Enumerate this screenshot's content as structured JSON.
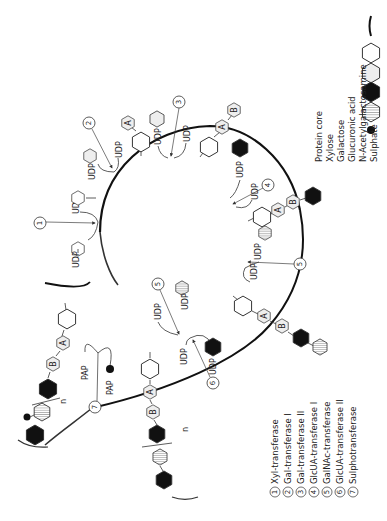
{
  "legend": {
    "items": [
      {
        "symbol": "protein-core-line",
        "label": "Protein  core"
      },
      {
        "symbol": "white-hexagon",
        "label": "Xylose"
      },
      {
        "symbol": "light-gray-hexagon",
        "label": "Galactose"
      },
      {
        "symbol": "black-hexagon",
        "label": "Glucuronic  acid"
      },
      {
        "symbol": "hatched-hexagon",
        "label": "N-Acetylgalactosamine"
      },
      {
        "symbol": "black-dot",
        "label": "Sulphate"
      }
    ]
  },
  "enzymes": {
    "items": [
      {
        "num": "1",
        "label": "Xyl-transferase"
      },
      {
        "num": "2",
        "label": "Gal-transferase I"
      },
      {
        "num": "3",
        "label": "Gal-transferase II"
      },
      {
        "num": "4",
        "label": "GlcUA-transferase I"
      },
      {
        "num": "5",
        "label": "GalNAc-transferase"
      },
      {
        "num": "6",
        "label": "GlcUA-transferase II"
      },
      {
        "num": "7",
        "label": "Sulphotransferase"
      }
    ]
  },
  "diagram": {
    "donor": "UDP",
    "sulfate_donor": "PAP",
    "sugar_a": "A",
    "sugar_b": "B",
    "repeat": "n",
    "step_numbers": [
      "1",
      "2",
      "3",
      "4",
      "5",
      "6",
      "7"
    ]
  },
  "colors": {
    "ink": "#111111",
    "galactose_fill": "#eeeeee",
    "background": "#ffffff"
  }
}
